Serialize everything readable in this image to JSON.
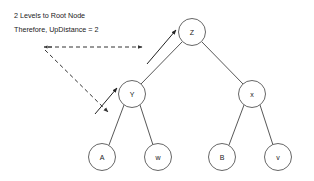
{
  "diagram": {
    "type": "binary-tree",
    "annotation": {
      "line1": "2 Levels to Root Node",
      "line2": "Therefore, UpDistance = 2"
    },
    "nodes": [
      {
        "id": "root",
        "label": "Z",
        "cx": 192,
        "cy": 32,
        "r": 13.5
      },
      {
        "id": "left-child",
        "label": "Y",
        "cx": 132,
        "cy": 94,
        "r": 13.5
      },
      {
        "id": "right-child",
        "label": "x",
        "cx": 252,
        "cy": 94,
        "r": 13.5
      },
      {
        "id": "leaf-a",
        "label": "A",
        "cx": 102,
        "cy": 157,
        "r": 13.5
      },
      {
        "id": "leaf-w",
        "label": "w",
        "cx": 158,
        "cy": 157,
        "r": 13.5
      },
      {
        "id": "leaf-b",
        "label": "B",
        "cx": 222,
        "cy": 157,
        "r": 13.5
      },
      {
        "id": "leaf-v",
        "label": "v",
        "cx": 278,
        "cy": 157,
        "r": 13.5
      }
    ],
    "edges": [
      {
        "from": "root",
        "to": "left-child"
      },
      {
        "from": "root",
        "to": "right-child"
      },
      {
        "from": "left-child",
        "to": "leaf-a"
      },
      {
        "from": "left-child",
        "to": "leaf-w"
      },
      {
        "from": "right-child",
        "to": "leaf-b"
      },
      {
        "from": "right-child",
        "to": "leaf-v"
      }
    ],
    "arrows": [
      {
        "id": "dashed-horizontal",
        "style": "dashed",
        "x1": 46,
        "y1": 48,
        "x2": 143,
        "y2": 48
      },
      {
        "id": "dashed-diagonal",
        "style": "dashed",
        "x1": 45,
        "y1": 49,
        "x2": 110,
        "y2": 110
      },
      {
        "id": "solid-to-y",
        "style": "solid",
        "x1": 96,
        "y1": 113,
        "x2": 117,
        "y2": 88
      },
      {
        "id": "solid-to-z",
        "style": "solid",
        "x1": 148,
        "y1": 62,
        "x2": 175,
        "y2": 30
      }
    ],
    "colors": {
      "background": "#ffffff",
      "stroke": "#555555",
      "text": "#1a1a1a"
    }
  }
}
